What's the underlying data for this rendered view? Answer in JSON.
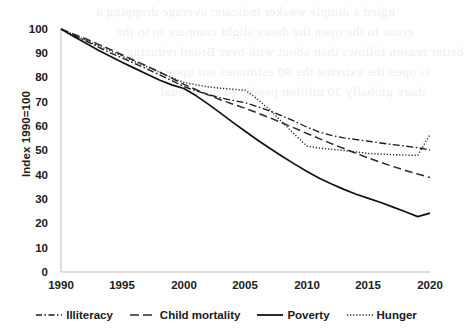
{
  "chart_data": {
    "type": "line",
    "title": "",
    "subtitle": "",
    "xlabel": "",
    "ylabel": "Index 1990=100",
    "xlim": [
      1990,
      2020
    ],
    "ylim": [
      0,
      100
    ],
    "yticks": [
      0,
      10,
      20,
      30,
      40,
      50,
      60,
      70,
      80,
      90,
      100
    ],
    "xticks": [
      1990,
      1995,
      2000,
      2005,
      2010,
      2015,
      2020
    ],
    "grid": false,
    "legend_position": "bottom",
    "x": [
      1990,
      1991,
      1992,
      1993,
      1994,
      1995,
      1996,
      1997,
      1998,
      1999,
      2000,
      2001,
      2002,
      2003,
      2004,
      2005,
      2006,
      2007,
      2008,
      2009,
      2010,
      2011,
      2012,
      2013,
      2014,
      2015,
      2016,
      2017,
      2018,
      2019,
      2020
    ],
    "series": [
      {
        "name": "Illiteracy",
        "line_style": "dash-dot",
        "color": "#1a1a1a",
        "values": [
          100,
          97.5,
          95.2,
          92.6,
          90.2,
          88.0,
          85.8,
          83.5,
          81.2,
          78.8,
          76.3,
          74.5,
          73.0,
          71.6,
          70.6,
          69.6,
          68.0,
          66.2,
          64.2,
          62.0,
          59.6,
          57.6,
          56.2,
          55.2,
          54.5,
          53.8,
          53.1,
          52.4,
          51.8,
          51.2,
          50.2
        ]
      },
      {
        "name": "Child mortality",
        "line_style": "dashed",
        "color": "#2b2b2b",
        "values": [
          100,
          98.0,
          96.0,
          93.8,
          91.6,
          89.3,
          87.0,
          84.7,
          82.3,
          79.8,
          77.2,
          75.0,
          72.8,
          70.8,
          69.0,
          67.3,
          65.4,
          63.4,
          61.3,
          59.2,
          57.0,
          54.9,
          52.8,
          50.8,
          48.8,
          46.9,
          45.1,
          43.4,
          41.8,
          40.3,
          38.9
        ]
      },
      {
        "name": "Poverty",
        "line_style": "solid",
        "color": "#111111",
        "values": [
          100,
          97.0,
          94.2,
          91.4,
          88.8,
          86.2,
          83.8,
          81.4,
          79.0,
          77.0,
          75.5,
          72.5,
          69.0,
          65.3,
          61.5,
          57.8,
          54.2,
          50.8,
          47.5,
          44.4,
          41.4,
          38.6,
          36.2,
          34.0,
          32.0,
          30.3,
          28.6,
          26.7,
          24.8,
          22.8,
          24.2
        ]
      },
      {
        "name": "Hunger",
        "line_style": "dotted",
        "color": "#262626",
        "values": [
          100,
          97.6,
          95.4,
          93.2,
          91.0,
          88.8,
          86.6,
          84.4,
          82.2,
          80.0,
          78.0,
          77.0,
          76.2,
          75.6,
          75.2,
          74.8,
          71.0,
          66.6,
          61.6,
          56.6,
          51.8,
          51.0,
          50.5,
          50.0,
          49.4,
          48.8,
          48.5,
          48.3,
          48.1,
          48.0,
          56.6
        ]
      }
    ]
  },
  "legend": {
    "items": [
      {
        "label": "Illiteracy",
        "icon": "dash-dot-line-icon"
      },
      {
        "label": "Child mortality",
        "icon": "dashed-line-icon"
      },
      {
        "label": "Poverty",
        "icon": "solid-line-icon"
      },
      {
        "label": "Hunger",
        "icon": "dotted-line-icon"
      }
    ]
  },
  "axes": {
    "y_title": "Index 1990=100",
    "y_ticks": [
      "100",
      "90",
      "80",
      "70",
      "60",
      "50",
      "40",
      "30",
      "20",
      "10",
      "0"
    ],
    "x_ticks": [
      "1990",
      "1995",
      "2000",
      "2005",
      "2010",
      "2015",
      "2020"
    ]
  },
  "background_bleed": {
    "lines": [
      "ngled a dimple weaker indicate: average dropping a",
      "erous in the open the doors slight compare in to the",
      "better reason follows than about with over Broad reducing",
      "is open the extreme the 90 estimates out upon in",
      "share globally 30 million people of the annual"
    ]
  }
}
